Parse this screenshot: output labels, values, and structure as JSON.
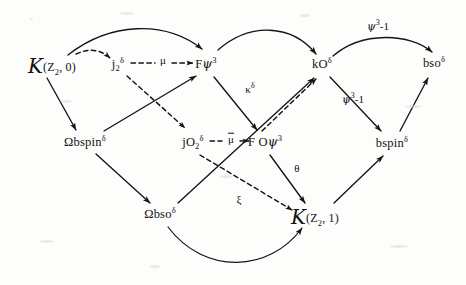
{
  "diagram": {
    "background_color": "#fdfdfc",
    "ink_color": "#111111",
    "nodes": [
      {
        "id": "kz20",
        "label": "K(Z2,0)",
        "x": 52,
        "y": 64,
        "head": "K",
        "paren": "(Z",
        "sub": "2",
        "tail": ", 0)"
      },
      {
        "id": "j2d",
        "label": "j2^d",
        "x": 118,
        "y": 64
      },
      {
        "id": "fpsi3",
        "label": "Fpsi^3",
        "x": 206,
        "y": 64
      },
      {
        "id": "kOd",
        "label": "kO^d",
        "x": 322,
        "y": 64
      },
      {
        "id": "bsod",
        "label": "bso^d",
        "x": 434,
        "y": 63
      },
      {
        "id": "obspind",
        "label": "Obspin^d",
        "x": 85,
        "y": 142
      },
      {
        "id": "jO2d",
        "label": "jO2^d",
        "x": 193,
        "y": 142
      },
      {
        "id": "FOpsi3",
        "label": "FOpsi^3",
        "x": 265,
        "y": 142
      },
      {
        "id": "bspind",
        "label": "bspin^d",
        "x": 392,
        "y": 143
      },
      {
        "id": "obsod",
        "label": "Obso^d",
        "x": 160,
        "y": 214
      },
      {
        "id": "kz21",
        "label": "K(Z2,1)",
        "x": 315,
        "y": 215,
        "head": "K",
        "paren": "(Z",
        "sub": "2",
        "tail": ", 1)"
      }
    ],
    "node_text": {
      "kz20_paren": "(Z",
      "kz20_sub": "2",
      "kz20_tail": ", 0)",
      "kz21_paren": "(Z",
      "kz21_sub": "2",
      "kz21_tail": ", 1)",
      "script_k": "K",
      "j2_base": "j",
      "j2_sub": "2",
      "j2_sup": "δ",
      "fpsi_base": "F",
      "fpsi_glyph": "ψ",
      "fpsi_sup": "3",
      "kO_base": "kO",
      "kO_sup": "δ",
      "bso_base": "bso",
      "bso_sup": "δ",
      "obspin_base": "Ωbspin",
      "obspin_sup": "δ",
      "jO2_base": "jO",
      "jO2_sub": "2",
      "jO2_sup": "δ",
      "FOpsi_base": "F O",
      "FOpsi_glyph": "ψ",
      "FOpsi_sup": "3",
      "bspin_base": "bspin",
      "bspin_sup": "δ",
      "obso_base": "Ωbso",
      "obso_sup": "δ"
    },
    "edge_labels": [
      {
        "id": "mu-top",
        "text": "μ",
        "x": 162,
        "y": 60,
        "overbar": false
      },
      {
        "id": "mubar-mid",
        "text": "μ",
        "x": 230,
        "y": 138,
        "overbar": true
      },
      {
        "id": "kappa",
        "text": "κ",
        "sup": "δ",
        "x": 250,
        "y": 89
      },
      {
        "id": "psi3-1-top",
        "text": "ψ",
        "sup": "3",
        "suffix": "-1",
        "x": 376,
        "y": 26
      },
      {
        "id": "psi3-1-mid",
        "text": "ψ",
        "sup": "3",
        "suffix": "-1",
        "x": 351,
        "y": 99
      },
      {
        "id": "theta",
        "text": "θ",
        "x": 297,
        "y": 168
      },
      {
        "id": "xi",
        "text": "ξ",
        "x": 239,
        "y": 199
      }
    ],
    "edges": [
      {
        "from": "kz20",
        "to": "fpsi3",
        "style": "solid-curve"
      },
      {
        "from": "kz20",
        "to": "j2d",
        "style": "dashed-curve"
      },
      {
        "from": "j2d",
        "to": "fpsi3",
        "style": "dashed",
        "label": "mu-top"
      },
      {
        "from": "kz20",
        "to": "obspind",
        "style": "solid"
      },
      {
        "from": "j2d",
        "to": "jO2d",
        "style": "dashed"
      },
      {
        "from": "fpsi3",
        "to": "kOd",
        "style": "solid-curve"
      },
      {
        "from": "fpsi3",
        "to": "FOpsi3",
        "style": "solid"
      },
      {
        "from": "obspind",
        "to": "fpsi3",
        "style": "solid"
      },
      {
        "from": "obspind",
        "to": "obsod",
        "style": "solid"
      },
      {
        "from": "jO2d",
        "to": "FOpsi3",
        "style": "dashed",
        "label": "mubar-mid"
      },
      {
        "from": "jO2d",
        "to": "kz21",
        "style": "dashed",
        "label": "xi"
      },
      {
        "from": "FOpsi3",
        "to": "kOd",
        "style": "dashed",
        "label": "kappa"
      },
      {
        "from": "FOpsi3",
        "to": "kz21",
        "style": "solid",
        "label": "theta"
      },
      {
        "from": "obsod",
        "to": "kOd",
        "style": "solid"
      },
      {
        "from": "obsod",
        "to": "kz21",
        "style": "solid-curve"
      },
      {
        "from": "kOd",
        "to": "bsod",
        "style": "solid-curve",
        "label": "psi3-1-top"
      },
      {
        "from": "kOd",
        "to": "bspind",
        "style": "solid",
        "label": "psi3-1-mid"
      },
      {
        "from": "bspind",
        "to": "bsod",
        "style": "solid"
      },
      {
        "from": "kz21",
        "to": "bspind",
        "style": "solid"
      }
    ]
  }
}
